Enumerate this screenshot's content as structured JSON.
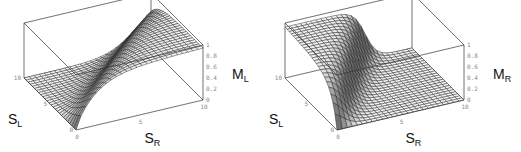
{
  "chart_data": [
    {
      "type": "surface3d",
      "title": "",
      "xlabel": "S_R",
      "ylabel": "S_L",
      "zlabel": "M_L",
      "xlabel_main": "S",
      "xlabel_sub": "R",
      "ylabel_main": "S",
      "ylabel_sub": "L",
      "zlabel_main": "M",
      "zlabel_sub": "L",
      "xlim": [
        0,
        10
      ],
      "ylim": [
        0,
        10
      ],
      "zlim": [
        0,
        1
      ],
      "x_ticks": [
        "0",
        "5",
        "10"
      ],
      "y_ticks": [
        "0",
        "5",
        "10"
      ],
      "z_ticks": [
        "0",
        "0.2",
        "0.4",
        "0.6",
        "0.8",
        "1"
      ],
      "grid_n": 25,
      "description": "M_L rises from ~0 to ~1 along a ridge as S_R increases relative to S_L; plateau ~1 at high S_R, near 0 at high S_L",
      "surface": "sigmoid_left"
    },
    {
      "type": "surface3d",
      "title": "",
      "xlabel": "S_R",
      "ylabel": "S_L",
      "zlabel": "M_R",
      "xlabel_main": "S",
      "xlabel_sub": "R",
      "ylabel_main": "S",
      "ylabel_sub": "L",
      "zlabel_main": "M",
      "zlabel_sub": "R",
      "xlim": [
        0,
        10
      ],
      "ylim": [
        0,
        10
      ],
      "zlim": [
        0,
        1
      ],
      "x_ticks": [
        "0",
        "5",
        "10"
      ],
      "y_ticks": [
        "0",
        "5",
        "10"
      ],
      "z_ticks": [
        "0",
        "0.2",
        "0.4",
        "0.6",
        "0.8",
        "1"
      ],
      "grid_n": 25,
      "description": "M_R near 1 at high S_L with low-moderate S_R, drops sharply to 0 for larger S_R; near 0 elsewhere",
      "surface": "sigmoid_right"
    }
  ]
}
